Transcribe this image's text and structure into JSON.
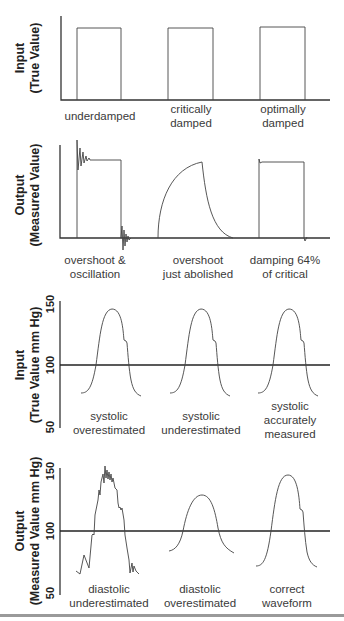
{
  "title_partial": "...",
  "panels": [
    {
      "id": "square-input",
      "ylabel_line1": "Input",
      "ylabel_line2": "(True Value)",
      "captions": [
        {
          "line1": "underdamped",
          "line2": ""
        },
        {
          "line1": "critically",
          "line2": "damped"
        },
        {
          "line1": "optimally",
          "line2": "damped"
        }
      ]
    },
    {
      "id": "square-output",
      "ylabel_line1": "Output",
      "ylabel_line2": "(Measured Value)",
      "captions": [
        {
          "line1": "overshoot &",
          "line2": "oscillation"
        },
        {
          "line1": "overshoot",
          "line2": "just abolished"
        },
        {
          "line1": "damping 64%",
          "line2": "of critical"
        }
      ]
    },
    {
      "id": "arterial-input",
      "ylabel_line1": "Input",
      "ylabel_line2": "(True Value mm Hg)",
      "ticks": [
        "150",
        "100",
        "50"
      ],
      "captions": [
        {
          "line1": "systolic",
          "line2": "overestimated",
          "line3": ""
        },
        {
          "line1": "systolic",
          "line2": "underestimated",
          "line3": ""
        },
        {
          "line1": "systolic",
          "line2": "accurately",
          "line3": "measured"
        }
      ]
    },
    {
      "id": "arterial-output",
      "ylabel_line1": "Output",
      "ylabel_line2": "(Measured Value mm Hg)",
      "ticks": [
        "150",
        "100",
        "50"
      ],
      "captions": [
        {
          "line1": "diastolic",
          "line2": "underestimated"
        },
        {
          "line1": "diastolic",
          "line2": "overestimated"
        },
        {
          "line1": "correct",
          "line2": "waveform"
        }
      ]
    }
  ],
  "colors": {
    "line": "#444444",
    "axis": "#333333",
    "text": "#3a3a3a",
    "background": "#ffffff"
  }
}
